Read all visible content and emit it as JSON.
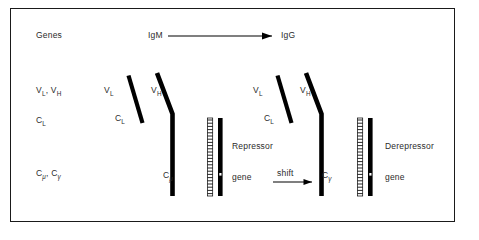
{
  "figure": {
    "title_row": {
      "genes_label": "Genes",
      "igm_label": "IgM",
      "igg_label": "IgG",
      "arrow_icon": "right-arrow-icon"
    },
    "legend_column": [
      {
        "id": "v-genes",
        "text": "V",
        "sub1": "L",
        "text2": ", V",
        "sub2": "H"
      },
      {
        "id": "cl-gene",
        "text": "C",
        "sub1": "L"
      },
      {
        "id": "c-heavy-genes",
        "text": "C",
        "sub1": "μ",
        "text2": ", C",
        "sub2": "γ"
      }
    ],
    "legend_plain": {
      "v_genes": "VL, VH",
      "cl_gene": "CL",
      "c_heavy_genes": "Cμ, Cγ"
    },
    "left_panel": {
      "name": "igm-molecule",
      "vl_label": "V",
      "vl_sub": "L",
      "vh_label": "V",
      "vh_sub": "H",
      "cl_label": "C",
      "cl_sub": "L",
      "ch_label": "C",
      "ch_sub": "μ"
    },
    "right_panel": {
      "name": "igg-molecule",
      "vl_label": "V",
      "vl_sub": "L",
      "vh_label": "V",
      "vh_sub": "H",
      "cl_label": "C",
      "cl_sub": "L",
      "ch_label": "C",
      "ch_sub": "γ"
    },
    "repressor": {
      "line1": "Repressor",
      "line2": "gene"
    },
    "derepressor": {
      "line1": "Derepressor",
      "line2": "gene"
    },
    "shift": {
      "label": "shift",
      "arrow_icon": "right-arrow-icon"
    },
    "colors": {
      "ink": "#000000",
      "text": "#2b2b2b",
      "frame": "#1a1a1a",
      "background": "#ffffff"
    }
  }
}
